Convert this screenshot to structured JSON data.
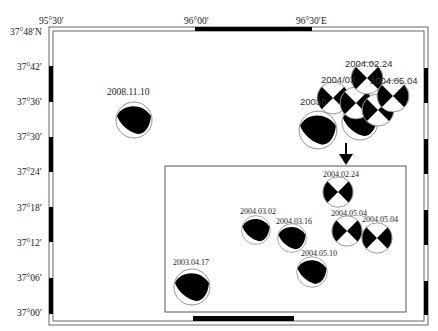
{
  "map": {
    "top_axis": {
      "labels": [
        "95°30′",
        "96°00′",
        "96°30′E"
      ]
    },
    "left_axis": {
      "labels": [
        "37°48′N",
        "37°42′",
        "37°36′",
        "37°30′",
        "37°24′",
        "37°18′",
        "37°12′",
        "37°06′",
        "37°00′"
      ]
    },
    "colors": {
      "frame": "#555555",
      "fill": "#000000",
      "circle": "#777777"
    }
  },
  "main_events": [
    {
      "label": "2008.11.10",
      "type": "thrust"
    },
    {
      "label": "2004.02.24",
      "type": "strike-slip"
    },
    {
      "label": "2004/03",
      "type": "overlap-label"
    },
    {
      "label": "2004.05.04",
      "type": "strike-slip"
    },
    {
      "label": "20030",
      "type": "thrust"
    }
  ],
  "inset": {
    "arrow": "down-arrow",
    "events": [
      {
        "label": "2004.02.24",
        "type": "strike-slip"
      },
      {
        "label": "2004.03.02",
        "type": "thrust"
      },
      {
        "label": "2004.03.16",
        "type": "thrust"
      },
      {
        "label": "2004.05.04",
        "type": "strike-slip"
      },
      {
        "label": "2004.05.04",
        "type": "strike-slip"
      },
      {
        "label": "2004.05.10",
        "type": "thrust"
      },
      {
        "label": "2003.04.17",
        "type": "thrust"
      }
    ]
  }
}
